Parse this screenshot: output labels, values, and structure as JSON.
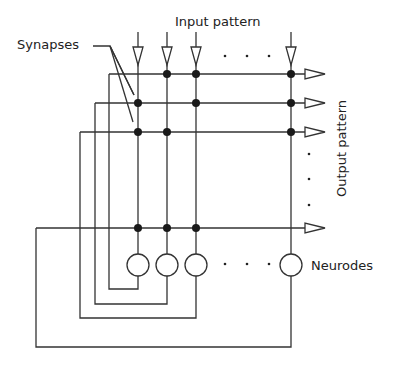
{
  "labels": {
    "input": "Input pattern",
    "output": "Output pattern",
    "synapses": "Synapses",
    "neurodes": "Neurodes"
  },
  "grid": {
    "columns_x": [
      138,
      167,
      196,
      291
    ],
    "rows_y": [
      74,
      103,
      132,
      228
    ],
    "synapses": [
      [
        1,
        2
      ],
      [
        0,
        1
      ],
      [
        0,
        2
      ],
      [
        0,
        1
      ],
      [
        0,
        1,
        2
      ]
    ]
  },
  "colors": {
    "line": "#333333",
    "dot": "#1a1a1a"
  }
}
